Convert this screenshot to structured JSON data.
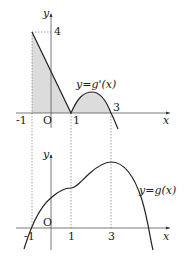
{
  "top_graph": {
    "function_label": "y=g'(x)",
    "y_axis_label": "y",
    "x_axis_label": "x",
    "origin_label": "O",
    "y_tick_label": "4",
    "x_tick_labels": [
      "-1",
      "1",
      "3"
    ]
  },
  "bottom_graph": {
    "function_label": "y=g(x)",
    "y_axis_label": "y",
    "x_axis_label": "x",
    "origin_label": "O",
    "x_tick_labels": [
      "-1",
      "1",
      "3"
    ]
  },
  "colors": {
    "curve": "#222222",
    "shade": "#d9d9d9",
    "dashed": "#555555"
  }
}
